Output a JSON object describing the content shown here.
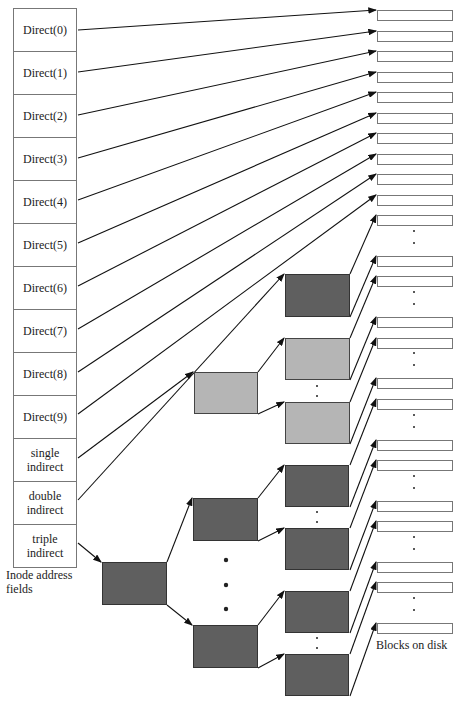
{
  "inode": {
    "fields": [
      "Direct(0)",
      "Direct(1)",
      "Direct(2)",
      "Direct(3)",
      "Direct(4)",
      "Direct(5)",
      "Direct(6)",
      "Direct(7)",
      "Direct(8)",
      "Direct(9)",
      "single indirect",
      "double indirect",
      "triple indirect"
    ],
    "caption_line1": "Inode address",
    "caption_line2": "fields"
  },
  "disk": {
    "label": "Blocks on disk"
  },
  "colors": {
    "dark_block": "#5f5f5f",
    "light_block": "#b5b5b5",
    "line": "#111111"
  }
}
